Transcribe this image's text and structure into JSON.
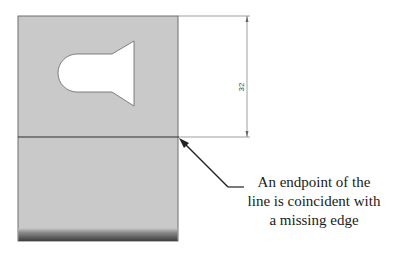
{
  "diagram": {
    "panel": {
      "fill": "#c9c9c9",
      "edge": "#6f6f6f",
      "shade_dark": "#4a4a4a"
    },
    "dimension": {
      "value": "32",
      "color": "#555555"
    },
    "callout": {
      "lines": [
        "An endpoint of the",
        "line is coincident with",
        "a missing edge"
      ]
    }
  }
}
